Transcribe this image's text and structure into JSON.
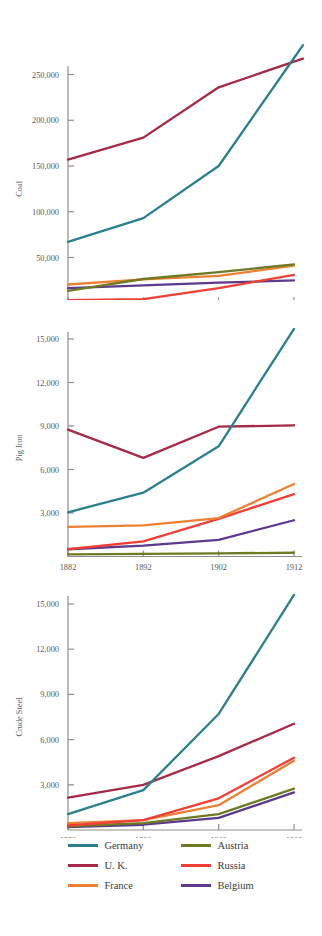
{
  "chart_data": [
    {
      "type": "line",
      "title": "",
      "ylabel": "Coal",
      "xlabel": "",
      "x": [
        1882,
        1892,
        1902,
        1912
      ],
      "xtick_labels": [
        "1882",
        "1892",
        "1902",
        "1912"
      ],
      "ytick_values": [
        50000,
        100000,
        150000,
        200000,
        250000
      ],
      "ytick_labels": [
        "50,000",
        "100,000",
        "150,000",
        "200,000",
        "250,000"
      ],
      "ylim": [
        0,
        275000
      ],
      "xlim": [
        1882,
        1912
      ],
      "grid": false,
      "legend_position": "bottom",
      "series": [
        {
          "name": "Germany",
          "color": "#2b7f8f",
          "values": [
            67000,
            93000,
            150000,
            268000
          ]
        },
        {
          "name": "U. K.",
          "color": "#a62a47",
          "values": [
            157000,
            181000,
            236000,
            264000
          ]
        },
        {
          "name": "France",
          "color": "#ee8033",
          "values": [
            20500,
            26000,
            30000,
            41000
          ]
        },
        {
          "name": "Austria",
          "color": "#6e7b22",
          "values": [
            13500,
            26500,
            34000,
            42500
          ]
        },
        {
          "name": "Russia",
          "color": "#ee4036",
          "values": [
            3500,
            4500,
            16500,
            31000
          ]
        },
        {
          "name": "Belgium",
          "color": "#5d3a8e",
          "values": [
            16500,
            19500,
            22500,
            25000
          ]
        }
      ]
    },
    {
      "type": "line",
      "title": "",
      "ylabel": "Pig Iron",
      "xlabel": "",
      "x": [
        1882,
        1892,
        1902,
        1912
      ],
      "xtick_labels": [
        "1882",
        "1892",
        "1902",
        "1912"
      ],
      "ytick_values": [
        3000,
        6000,
        9000,
        12000,
        15000
      ],
      "ytick_labels": [
        "3,000",
        "6,000",
        "9,000",
        "12,000",
        "15,000"
      ],
      "ylim": [
        0,
        16500
      ],
      "xlim": [
        1882,
        1912
      ],
      "grid": false,
      "legend_position": "bottom",
      "series": [
        {
          "name": "Germany",
          "color": "#2b7f8f",
          "values": [
            3050,
            4400,
            7600,
            15700
          ]
        },
        {
          "name": "U. K.",
          "color": "#a62a47",
          "values": [
            8750,
            6800,
            8950,
            9050
          ]
        },
        {
          "name": "France",
          "color": "#ee8033",
          "values": [
            2050,
            2150,
            2650,
            5000
          ]
        },
        {
          "name": "Austria",
          "color": "#6e7b22",
          "values": [
            150,
            180,
            220,
            260
          ]
        },
        {
          "name": "Russia",
          "color": "#ee4036",
          "values": [
            500,
            1050,
            2600,
            4300
          ]
        },
        {
          "name": "Belgium",
          "color": "#5d3a8e",
          "values": [
            500,
            750,
            1150,
            2500
          ]
        }
      ]
    },
    {
      "type": "line",
      "title": "",
      "ylabel": "Crude Steel",
      "xlabel": "",
      "x": [
        1882,
        1892,
        1902,
        1912
      ],
      "xtick_labels": [
        "1882",
        "1892",
        "1902",
        "1912"
      ],
      "ytick_values": [
        3000,
        6000,
        9000,
        12000,
        15000
      ],
      "ytick_labels": [
        "3,000",
        "6,000",
        "9,000",
        "12,000",
        "15,000"
      ],
      "ylim": [
        0,
        16500
      ],
      "xlim": [
        1882,
        1912
      ],
      "grid": false,
      "legend_position": "bottom",
      "series": [
        {
          "name": "Germany",
          "color": "#2b7f8f",
          "values": [
            1050,
            2650,
            7700,
            15600
          ]
        },
        {
          "name": "U. K.",
          "color": "#a62a47",
          "values": [
            2150,
            3000,
            4900,
            7050
          ]
        },
        {
          "name": "France",
          "color": "#ee8033",
          "values": [
            450,
            650,
            1650,
            4600
          ]
        },
        {
          "name": "Austria",
          "color": "#6e7b22",
          "values": [
            250,
            450,
            1050,
            2750
          ]
        },
        {
          "name": "Russia",
          "color": "#ee4036",
          "values": [
            300,
            650,
            2100,
            4800
          ]
        },
        {
          "name": "Belgium",
          "color": "#5d3a8e",
          "values": [
            200,
            350,
            800,
            2500
          ]
        }
      ]
    }
  ],
  "panels": [
    {
      "ylabel": "Coal"
    },
    {
      "ylabel": "Pig Iron"
    },
    {
      "ylabel": "Crude Steel"
    }
  ],
  "legend": {
    "columns": [
      [
        {
          "label": "Germany",
          "color": "#2b7f8f"
        },
        {
          "label": "U. K.",
          "color": "#a62a47"
        },
        {
          "label": "France",
          "color": "#ee8033"
        }
      ],
      [
        {
          "label": "Austria",
          "color": "#6e7b22"
        },
        {
          "label": "Russia",
          "color": "#ee4036"
        },
        {
          "label": "Belgium",
          "color": "#5d3a8e"
        }
      ]
    ]
  },
  "colors": {
    "germany": "#2b7f8f",
    "uk": "#a62a47",
    "france": "#ee8033",
    "austria": "#6e7b22",
    "russia": "#ee4036",
    "belgium": "#5d3a8e",
    "axis": "#8d8d8f",
    "text": "#58585a"
  }
}
